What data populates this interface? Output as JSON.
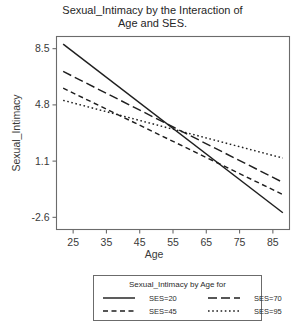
{
  "chart_data": {
    "type": "line",
    "title": "Sexual_Intimacy by the Interaction of Age and SES.",
    "title_line1": "Sexual_Intimacy by the Interaction of",
    "title_line2": "Age and SES.",
    "xlabel": "Age",
    "ylabel": "Sexual_Intimacy",
    "xticks": [
      25,
      35,
      45,
      55,
      65,
      75,
      85
    ],
    "xticklabels": [
      "25",
      "35",
      "45",
      "55",
      "65",
      "75",
      "85"
    ],
    "yticks": [
      8.5,
      4.8,
      1.1,
      -2.6
    ],
    "yticklabels": [
      "8.5",
      "4.8",
      "1.1",
      "-2.6"
    ],
    "xlim": [
      20,
      90
    ],
    "ylim": [
      -3.4,
      9.3
    ],
    "grid": false,
    "legend_position": "below-plot",
    "legend_title": "Sexual_Intimacy by Age for",
    "x": [
      22,
      88
    ],
    "series": [
      {
        "name": "SES=20",
        "label": "SES=20",
        "dash": "solid",
        "values": [
          8.8,
          -2.3
        ],
        "color": "#1f1f1f"
      },
      {
        "name": "SES=45",
        "label": "SES=45",
        "dash": "dashed",
        "values": [
          5.9,
          -1.1
        ],
        "color": "#1f1f1f"
      },
      {
        "name": "SES=70",
        "label": "SES=70",
        "dash": "longdash",
        "values": [
          7.0,
          -0.3
        ],
        "color": "#1f1f1f"
      },
      {
        "name": "SES=95",
        "label": "SES=95",
        "dash": "dotted",
        "values": [
          5.1,
          1.3
        ],
        "color": "#1f1f1f"
      }
    ],
    "legend_order": [
      "SES=20",
      "SES=70",
      "SES=45",
      "SES=95"
    ],
    "convergence_point": {
      "age": 54.8,
      "value": 2.7
    }
  }
}
